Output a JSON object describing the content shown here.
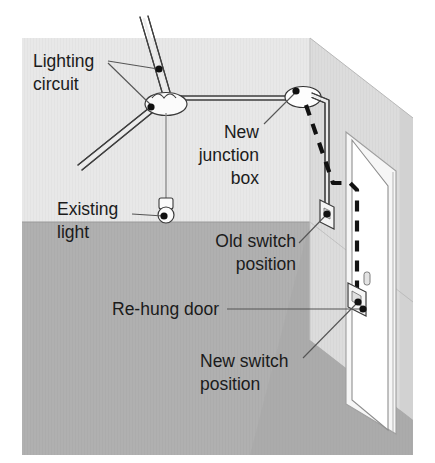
{
  "diagram": {
    "type": "isometric-room-wiring-diagram",
    "labels": {
      "lighting_circuit": {
        "line1": "Lighting",
        "line2": "circuit"
      },
      "new_junction_box": {
        "line1": "New",
        "line2": "junction",
        "line3": "box"
      },
      "existing_light": {
        "line1": "Existing",
        "line2": "light"
      },
      "old_switch": {
        "line1": "Old switch",
        "line2": "position"
      },
      "rehung_door": {
        "line1": "Re-hung door"
      },
      "new_switch": {
        "line1": "New switch",
        "line2": "position"
      }
    },
    "colors": {
      "back_wall": "#e8e8e8",
      "side_wall": "#d8d8d8",
      "side_wall_edge": "#cfcfcf",
      "floor": "#b0b0b0",
      "floor_shadow": "#a6a6a6",
      "door_panel": "#ffffff",
      "cable_outline": "#4a4a4a",
      "cable_fill": "#f2f2f2",
      "dashed_cable": "#111111",
      "leader_line": "#555555",
      "dot": "#111111",
      "text": "#1b1b1b",
      "fixture_fill": "#fbfbfb",
      "fixture_stroke": "#3a3a3a"
    },
    "elements": [
      {
        "name": "lighting-circuit-cable",
        "style": "solid-twin-line",
        "note": "two cables entering from top-left and lower-left into existing ceiling rose"
      },
      {
        "name": "existing-ceiling-rose",
        "shape": "ellipse"
      },
      {
        "name": "existing-pendant-light",
        "shape": "pendant-on-cord"
      },
      {
        "name": "new-junction-box",
        "shape": "ellipse"
      },
      {
        "name": "ceiling-cable-run",
        "style": "solid",
        "note": "rose to new junction box along wall/ceiling line"
      },
      {
        "name": "old-switch-cable",
        "style": "solid",
        "note": "junction box down side wall to old switch"
      },
      {
        "name": "new-switch-cable",
        "style": "dashed",
        "note": "junction box across door head to new switch"
      },
      {
        "name": "old-switch-plate",
        "shape": "parallelogram"
      },
      {
        "name": "new-switch-plate",
        "shape": "parallelogram"
      },
      {
        "name": "door-opening",
        "shape": "rectangle"
      },
      {
        "name": "door-panel",
        "shape": "open-door-leaf"
      },
      {
        "name": "door-handle",
        "shape": "small-rounded-rect"
      }
    ]
  }
}
